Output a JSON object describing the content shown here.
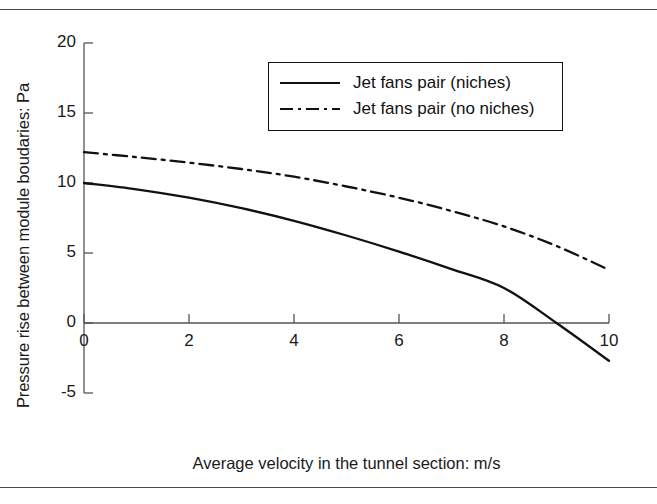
{
  "figure": {
    "has_top_rule": true,
    "has_bottom_rule": true
  },
  "chart_data": {
    "type": "line",
    "title": "",
    "xlabel": "Average velocity in the tunnel section: m/s",
    "ylabel": "Pressure rise between module boudaries: Pa",
    "xlim": [
      0,
      10
    ],
    "ylim": [
      -5,
      20
    ],
    "xticks": [
      0,
      2,
      4,
      6,
      8,
      10
    ],
    "xtick_labels": [
      "0",
      "2",
      "4",
      "6",
      "8",
      "10"
    ],
    "yticks": [
      -5,
      0,
      5,
      10,
      15,
      20
    ],
    "ytick_labels": [
      "-5",
      "0",
      "5",
      "10",
      "15",
      "20"
    ],
    "grid": false,
    "legend_position": "upper center",
    "line_color": "#111111",
    "series": [
      {
        "name": "Jet fans pair (niches)",
        "style": "solid",
        "x": [
          0,
          1,
          2,
          3,
          4,
          5,
          6,
          7,
          8,
          9,
          10
        ],
        "values": [
          10.0,
          9.55,
          8.95,
          8.2,
          7.3,
          6.25,
          5.1,
          3.85,
          2.5,
          0.0,
          -2.7
        ]
      },
      {
        "name": "Jet fans pair (no niches)",
        "style": "dashdot",
        "x": [
          0,
          1,
          2,
          3,
          4,
          5,
          6,
          7,
          8,
          9,
          10
        ],
        "values": [
          12.2,
          11.85,
          11.45,
          11.0,
          10.45,
          9.75,
          8.95,
          8.0,
          6.9,
          5.5,
          3.8
        ]
      }
    ],
    "annotations": {
      "zero_crossing_solid_x": 8.3
    }
  },
  "legend": {
    "items": [
      {
        "label": "Jet fans pair (niches)",
        "style": "solid"
      },
      {
        "label": "Jet fans pair (no niches)",
        "style": "dashdot"
      }
    ]
  },
  "axis_labels": {
    "x": "Average velocity in the tunnel section: m/s",
    "y": "Pressure rise between module boudaries: Pa"
  }
}
